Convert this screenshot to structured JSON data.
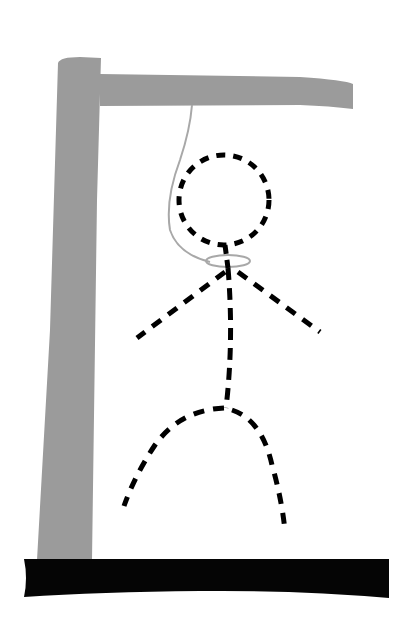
{
  "game": {
    "name": "hangman",
    "parts_visible": [
      "gallows-base",
      "gallows-post",
      "gallows-beam",
      "rope",
      "noose",
      "head",
      "body",
      "left-arm",
      "right-arm",
      "left-leg",
      "right-leg"
    ]
  },
  "colors": {
    "background": "#ffffff",
    "gallows_wood": "#9b9b9b",
    "base": "#050505",
    "rope": "#a8a8a8",
    "figure_stroke": "#000000"
  },
  "figure": {
    "head": {
      "cx": 224,
      "cy": 200,
      "r": 45
    },
    "neck": {
      "x1": 225,
      "y1": 245,
      "x2": 228,
      "y2": 268
    },
    "noose": {
      "cx": 228,
      "cy": 261,
      "rx": 22,
      "ry": 6
    },
    "shoulder": {
      "x": 228,
      "y": 268
    },
    "left_arm_end": {
      "x": 137,
      "y": 338
    },
    "right_arm_end": {
      "x": 320,
      "y": 332
    },
    "hip": {
      "x": 226,
      "y": 408
    },
    "left_leg_end": {
      "x": 124,
      "y": 506
    },
    "right_leg_end": {
      "x": 285,
      "y": 531
    }
  }
}
